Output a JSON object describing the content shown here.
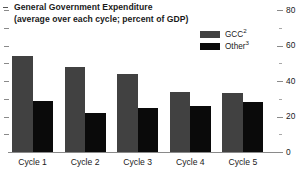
{
  "chart_data": {
    "type": "bar",
    "title": "General Government Expenditure",
    "subtitle": "(average over each cycle; percent of GDP)",
    "xlabel": "",
    "ylabel": "",
    "ylim": [
      0,
      80
    ],
    "ytick_labels": [
      "0",
      "20",
      "40",
      "60",
      "80"
    ],
    "ytick_values": [
      0,
      20,
      40,
      60,
      80
    ],
    "minor_ticks": [
      10,
      30,
      50,
      70
    ],
    "grid": false,
    "legend_position": "top-right",
    "categories": [
      "Cycle 1",
      "Cycle 2",
      "Cycle 3",
      "Cycle 4",
      "Cycle 5"
    ],
    "series": [
      {
        "name": "GCC",
        "name_footnote": "2",
        "color": "#414141",
        "values": [
          54,
          48,
          44,
          34,
          33
        ]
      },
      {
        "name": "Other",
        "name_footnote": "3",
        "color": "#0a0a0a",
        "values": [
          29,
          22,
          25,
          26,
          28
        ]
      }
    ]
  },
  "title_block": {
    "line1": "General Government Expenditure",
    "line2": "(average over each cycle; percent of GDP)"
  },
  "legend": {
    "items": [
      {
        "label": "GCC",
        "footnote": "2",
        "color": "#414141"
      },
      {
        "label": "Other",
        "footnote": "3",
        "color": "#0a0a0a"
      }
    ]
  },
  "colors": {
    "gcc": "#414141",
    "other": "#0a0a0a",
    "axis": "#8a8a8a",
    "text": "#1a1a1a",
    "background": "#ffffff"
  }
}
